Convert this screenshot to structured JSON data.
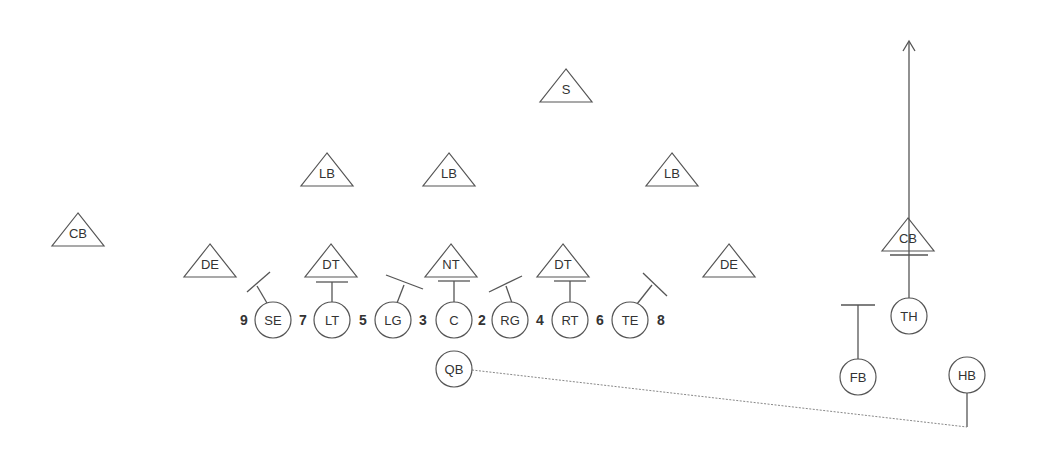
{
  "diagram": {
    "type": "football-play",
    "colors": {
      "background": "#ffffff",
      "stroke": "#555555",
      "text": "#333333"
    },
    "defense": [
      {
        "id": "s",
        "label": "S",
        "x": 566,
        "y": 88
      },
      {
        "id": "lb1",
        "label": "LB",
        "x": 327,
        "y": 172
      },
      {
        "id": "lb2",
        "label": "LB",
        "x": 449,
        "y": 172
      },
      {
        "id": "lb3",
        "label": "LB",
        "x": 672,
        "y": 172
      },
      {
        "id": "cb1",
        "label": "CB",
        "x": 78,
        "y": 232
      },
      {
        "id": "de1",
        "label": "DE",
        "x": 210,
        "y": 263
      },
      {
        "id": "dt1",
        "label": "DT",
        "x": 331,
        "y": 263
      },
      {
        "id": "nt",
        "label": "NT",
        "x": 451,
        "y": 263
      },
      {
        "id": "dt2",
        "label": "DT",
        "x": 563,
        "y": 263
      },
      {
        "id": "de2",
        "label": "DE",
        "x": 729,
        "y": 263
      },
      {
        "id": "cb2",
        "label": "CB",
        "x": 908,
        "y": 237
      }
    ],
    "offense": [
      {
        "id": "se",
        "label": "SE",
        "x": 273,
        "y": 320
      },
      {
        "id": "lt",
        "label": "LT",
        "x": 332,
        "y": 320
      },
      {
        "id": "lg",
        "label": "LG",
        "x": 393,
        "y": 320
      },
      {
        "id": "c",
        "label": "C",
        "x": 454,
        "y": 320
      },
      {
        "id": "rg",
        "label": "RG",
        "x": 510,
        "y": 320
      },
      {
        "id": "rt",
        "label": "RT",
        "x": 570,
        "y": 320
      },
      {
        "id": "te",
        "label": "TE",
        "x": 630,
        "y": 320
      },
      {
        "id": "qb",
        "label": "QB",
        "x": 454,
        "y": 369
      },
      {
        "id": "th",
        "label": "TH",
        "x": 909,
        "y": 316
      },
      {
        "id": "fb",
        "label": "FB",
        "x": 858,
        "y": 377
      },
      {
        "id": "hb",
        "label": "HB",
        "x": 967,
        "y": 375
      }
    ],
    "gap_numbers": [
      {
        "label": "9",
        "x": 244,
        "y": 320
      },
      {
        "label": "7",
        "x": 303,
        "y": 320
      },
      {
        "label": "5",
        "x": 363,
        "y": 320
      },
      {
        "label": "3",
        "x": 423,
        "y": 320
      },
      {
        "label": "2",
        "x": 482,
        "y": 320
      },
      {
        "label": "4",
        "x": 540,
        "y": 320
      },
      {
        "label": "6",
        "x": 600,
        "y": 320
      },
      {
        "label": "8",
        "x": 661,
        "y": 320
      }
    ]
  }
}
